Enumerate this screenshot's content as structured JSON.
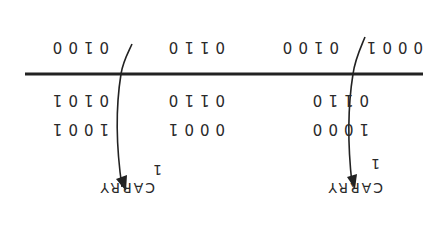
{
  "diagram": {
    "orientation_note": "Image is rotated 180 degrees",
    "addend_1": [
      "1000",
      "0001",
      "1001"
    ],
    "addend_2": [
      "0110",
      "0110",
      "0101"
    ],
    "sum": [
      "0001",
      "0100",
      "0110",
      "0100"
    ],
    "carries": [
      {
        "label": "CARRY",
        "value": "1"
      },
      {
        "label": "CARRY",
        "value": "1"
      }
    ],
    "line_color": "#222222",
    "text_color": "#2a2a2a"
  }
}
